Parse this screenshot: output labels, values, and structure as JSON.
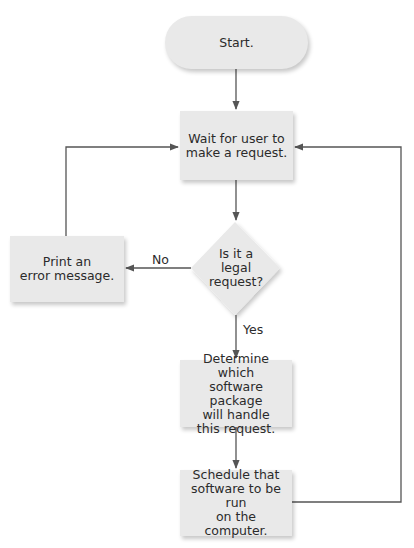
{
  "flowchart": {
    "nodes": {
      "start": {
        "type": "terminal",
        "label": "Start."
      },
      "wait": {
        "type": "process",
        "label": "Wait for user to\nmake a request."
      },
      "decision": {
        "type": "decision",
        "label": "Is it a\nlegal\nrequest?"
      },
      "error": {
        "type": "process",
        "label": "Print an\nerror message."
      },
      "determine": {
        "type": "process",
        "label": "Determine which\nsoftware package\nwill handle\nthis request."
      },
      "schedule": {
        "type": "process",
        "label": "Schedule that\nsoftware to be run\non the computer."
      }
    },
    "edges": [
      {
        "from": "start",
        "to": "wait",
        "label": ""
      },
      {
        "from": "wait",
        "to": "decision",
        "label": ""
      },
      {
        "from": "decision",
        "to": "error",
        "label": "No"
      },
      {
        "from": "error",
        "to": "wait",
        "label": ""
      },
      {
        "from": "decision",
        "to": "determine",
        "label": "Yes"
      },
      {
        "from": "determine",
        "to": "schedule",
        "label": ""
      },
      {
        "from": "schedule",
        "to": "wait",
        "label": ""
      }
    ],
    "edge_labels": {
      "no": "No",
      "yes": "Yes"
    }
  },
  "colors": {
    "node_fill": "#e9e9e9",
    "line": "#555555",
    "text": "#2b2b2b"
  }
}
